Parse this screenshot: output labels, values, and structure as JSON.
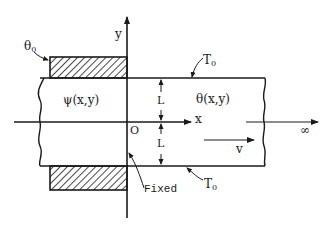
{
  "diagram": {
    "colors": {
      "stroke": "#1a1a1a",
      "background": "#ffffff"
    },
    "axes": {
      "x_label": "x",
      "y_label": "y",
      "origin_label": "O"
    },
    "regions": {
      "left_field": "ψ(x,y)",
      "right_field": "θ(x,y)"
    },
    "boundary_labels": {
      "left_hatched": {
        "symbol": "θ",
        "subscript": "0"
      },
      "top_wall": {
        "symbol": "T",
        "subscript": "0"
      },
      "bottom_wall": {
        "symbol": "T",
        "subscript": "0"
      },
      "fixed": "Fixed"
    },
    "dimensions": {
      "upper_half": "L",
      "lower_half": "L"
    },
    "flow": {
      "velocity_label": "v",
      "infinity_label": "∞"
    }
  }
}
